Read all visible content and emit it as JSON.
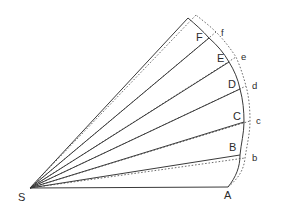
{
  "figure": {
    "background_color": "#ffffff",
    "stroke_color": "#3a3a3a",
    "dotted_color": "#6e6e6e",
    "label_color": "#2b2b2b",
    "apex": {
      "name": "S",
      "label": "S",
      "x": 30,
      "y": 188
    },
    "base_point": {
      "name": "A",
      "label": "A",
      "x": 228,
      "y": 187
    },
    "solid_vertices": [
      {
        "label": "A",
        "x": 228,
        "y": 187,
        "label_x": 224,
        "label_y": 199
      },
      {
        "label": "B",
        "x": 240,
        "y": 155,
        "label_x": 229,
        "label_y": 151
      },
      {
        "label": "C",
        "x": 244,
        "y": 122,
        "label_x": 233,
        "label_y": 120
      },
      {
        "label": "D",
        "x": 240,
        "y": 89,
        "label_x": 228,
        "label_y": 88
      },
      {
        "label": "E",
        "x": 229,
        "y": 62,
        "label_x": 217,
        "label_y": 62
      },
      {
        "label": "F",
        "x": 209,
        "y": 38,
        "label_x": 196,
        "label_y": 40
      },
      {
        "label": "",
        "x": 188,
        "y": 18,
        "label_x": 0,
        "label_y": 0
      }
    ],
    "dotted_vertices": [
      {
        "label": "b",
        "x": 245,
        "y": 158,
        "label_x": 252,
        "label_y": 160
      },
      {
        "label": "c",
        "x": 250,
        "y": 121,
        "label_x": 256,
        "label_y": 124
      },
      {
        "label": "d",
        "x": 246,
        "y": 86,
        "label_x": 252,
        "label_y": 89
      },
      {
        "label": "e",
        "x": 236,
        "y": 57,
        "label_x": 241,
        "label_y": 60
      },
      {
        "label": "f",
        "x": 216,
        "y": 32,
        "label_x": 221,
        "label_y": 36
      }
    ],
    "baseline": {
      "from": "S",
      "to": "A"
    },
    "solid_arc_label": "arc A-B-C-D-E-F-apex",
    "dotted_arc_label": "arc A-b-c-d-e-f"
  }
}
